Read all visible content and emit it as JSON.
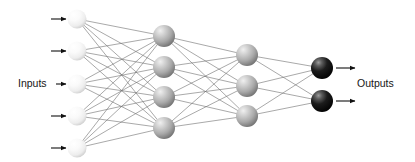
{
  "diagram": {
    "type": "neural-network",
    "title": "",
    "labels": {
      "inputs": "Inputs",
      "outputs": "Outputs"
    },
    "colors": {
      "background": "#ffffff",
      "edge": "#6e6e6e",
      "arrow": "#111111",
      "text": "#161616",
      "input_node_light": "#ffffff",
      "input_node_mid": "#f2f2f2",
      "input_node_dark": "#c9c9c9",
      "hidden2_node_light": "#e8e8e8",
      "hidden2_node_mid": "#b5b5b5",
      "hidden2_node_dark": "#7d7d7d",
      "hidden3_node_light": "#e3e3e3",
      "hidden3_node_mid": "#b0b0b0",
      "hidden3_node_dark": "#787878",
      "output_node_light": "#8e8e8e",
      "output_node_mid": "#2b2b2b",
      "output_node_dark": "#000000"
    },
    "layers": [
      {
        "name": "input-layer",
        "role": "input",
        "node_count": 5,
        "x": 77,
        "radius": 9.5,
        "style": "light",
        "nodes": [
          {
            "label": "",
            "cy": 19
          },
          {
            "label": "",
            "cy": 51
          },
          {
            "label": "",
            "cy": 84
          },
          {
            "label": "",
            "cy": 116
          },
          {
            "label": "",
            "cy": 148
          }
        ]
      },
      {
        "name": "hidden-layer-1",
        "role": "hidden",
        "node_count": 4,
        "x": 164,
        "radius": 11,
        "style": "mid-dark",
        "nodes": [
          {
            "label": "",
            "cy": 36
          },
          {
            "label": "",
            "cy": 67
          },
          {
            "label": "",
            "cy": 97
          },
          {
            "label": "",
            "cy": 128
          }
        ]
      },
      {
        "name": "hidden-layer-2",
        "role": "hidden",
        "node_count": 3,
        "x": 247,
        "radius": 11,
        "style": "mid-dark",
        "nodes": [
          {
            "label": "",
            "cy": 55
          },
          {
            "label": "",
            "cy": 86
          },
          {
            "label": "",
            "cy": 116
          }
        ]
      },
      {
        "name": "output-layer",
        "role": "output",
        "node_count": 2,
        "x": 322,
        "radius": 11,
        "style": "black",
        "nodes": [
          {
            "label": "",
            "cy": 68
          },
          {
            "label": "",
            "cy": 101
          }
        ]
      }
    ],
    "connections": [
      {
        "from": "input-layer",
        "to": "hidden-layer-1",
        "pattern": "fully-connected",
        "count": 20
      },
      {
        "from": "hidden-layer-1",
        "to": "hidden-layer-2",
        "pattern": "fully-connected",
        "count": 12
      },
      {
        "from": "hidden-layer-2",
        "to": "output-layer",
        "pattern": "fully-connected",
        "count": 6
      }
    ],
    "input_arrows": [
      {
        "y": 19,
        "x1": 51,
        "x2": 66
      },
      {
        "y": 51,
        "x1": 51,
        "x2": 66
      },
      {
        "y": 84,
        "x1": 56,
        "x2": 66
      },
      {
        "y": 116,
        "x1": 51,
        "x2": 66
      },
      {
        "y": 148,
        "x1": 51,
        "x2": 66
      }
    ],
    "output_arrows": [
      {
        "y": 68,
        "x1": 336,
        "x2": 355
      },
      {
        "y": 101,
        "x1": 336,
        "x2": 355
      }
    ],
    "label_positions": {
      "inputs": {
        "x": 18,
        "y": 84
      },
      "outputs": {
        "x": 357,
        "y": 84
      }
    }
  }
}
